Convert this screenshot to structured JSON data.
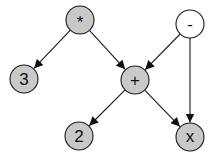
{
  "diagram": {
    "type": "expression-dag",
    "width": 217,
    "height": 157,
    "node_radius": 14,
    "colors": {
      "operator_fill": "#c9c9c9",
      "root_unfilled": "#ffffff",
      "stroke": "#1a1a1a",
      "text": "#111111"
    },
    "nodes": [
      {
        "id": "mul",
        "label": "*",
        "x": 80,
        "y": 20,
        "fill": "#c9c9c9",
        "label_dy": 2
      },
      {
        "id": "minus",
        "label": "-",
        "x": 190,
        "y": 24,
        "fill": "#ffffff",
        "label_dy": 0
      },
      {
        "id": "three",
        "label": "3",
        "x": 24,
        "y": 79,
        "fill": "#c9c9c9",
        "label_dy": 0
      },
      {
        "id": "plus",
        "label": "+",
        "x": 135,
        "y": 80,
        "fill": "#c9c9c9",
        "label_dy": 0
      },
      {
        "id": "two",
        "label": "2",
        "x": 79,
        "y": 136,
        "fill": "#c9c9c9",
        "label_dy": 0
      },
      {
        "id": "x",
        "label": "x",
        "x": 190,
        "y": 137,
        "fill": "#c9c9c9",
        "label_dy": -1
      }
    ],
    "edges": [
      {
        "from": "mul",
        "to": "three"
      },
      {
        "from": "mul",
        "to": "plus"
      },
      {
        "from": "minus",
        "to": "plus"
      },
      {
        "from": "minus",
        "to": "x"
      },
      {
        "from": "plus",
        "to": "two"
      },
      {
        "from": "plus",
        "to": "x"
      }
    ]
  }
}
